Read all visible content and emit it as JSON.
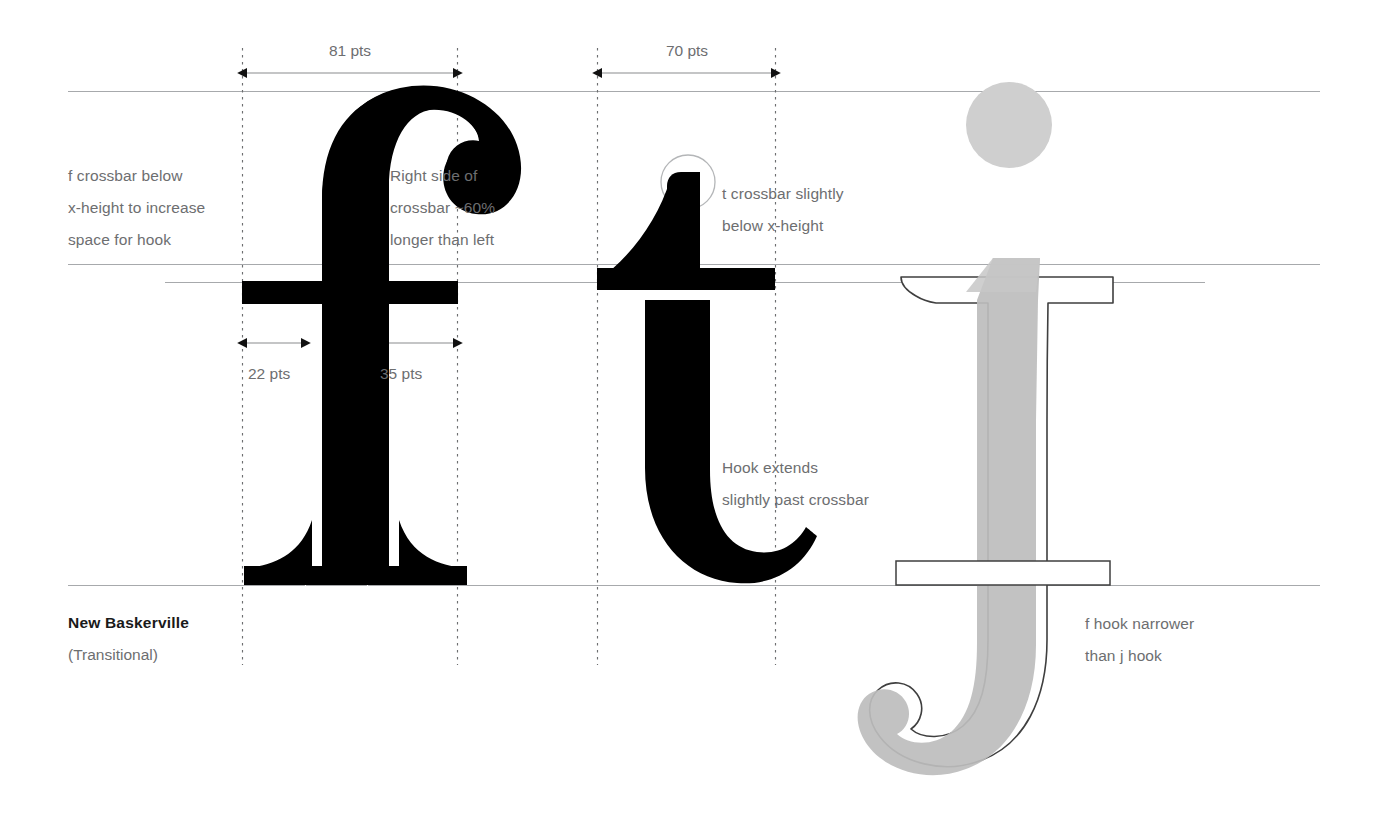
{
  "figure": {
    "typeface_name": "New Baskerville",
    "typeface_classification": "(Transitional)",
    "glyphs": [
      "f",
      "t",
      "j"
    ]
  },
  "dimensions": [
    {
      "id": "f-width",
      "label": "81 pts"
    },
    {
      "id": "t-width",
      "label": "70 pts"
    },
    {
      "id": "crossbar-left",
      "label": "22 pts"
    },
    {
      "id": "crossbar-right",
      "label": "35 pts"
    }
  ],
  "annotations": [
    {
      "id": "f-crossbar-note",
      "text": "f crossbar below\nx-height to increase\nspace for hook"
    },
    {
      "id": "crossbar-ratio-note",
      "text": "Right side of\ncrossbar ~60%\nlonger than left"
    },
    {
      "id": "t-crossbar-note",
      "text": "t crossbar slightly\nbelow x-height"
    },
    {
      "id": "t-hook-note",
      "text": "Hook extends\nslightly past crossbar"
    },
    {
      "id": "hook-compare-note",
      "text": "f hook narrower\nthan j hook"
    }
  ],
  "guides": {
    "ascender_label": "ascender line",
    "x_height_label": "x-height line",
    "secondary_label": "t crossbar line",
    "baseline_label": "baseline"
  },
  "colors": {
    "glyph_black": "#000000",
    "glyph_gray_fill": "#c9c9c9",
    "glyph_gray_stroke": "#4d4d4d",
    "guide_line": "#a7a9ac",
    "dotted_line": "#6d6e70",
    "text_gray": "#6d6e70",
    "text_dark": "#231f20",
    "background": "#ffffff"
  }
}
